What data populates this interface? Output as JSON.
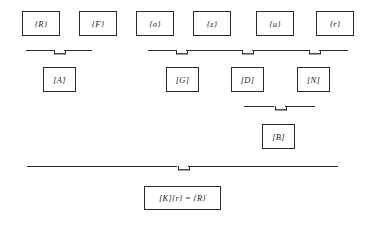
{
  "diagram": {
    "colors": {
      "stroke": "#2b2b2b",
      "text": "#1d1d1d",
      "background": "#ffffff"
    },
    "vectors": [
      {
        "label": "{R}",
        "name": "vector-R"
      },
      {
        "label": "{F}",
        "name": "vector-F"
      },
      {
        "label": "{σ}",
        "name": "vector-sigma"
      },
      {
        "label": "{ε}",
        "name": "vector-epsilon"
      },
      {
        "label": "{u}",
        "name": "vector-u"
      },
      {
        "label": "{r}",
        "name": "vector-r"
      }
    ],
    "matrices_row1": [
      {
        "label": "[A]",
        "name": "matrix-A"
      },
      {
        "label": "[G]",
        "name": "matrix-G"
      },
      {
        "label": "[D]",
        "name": "matrix-D"
      },
      {
        "label": "[N]",
        "name": "matrix-N"
      }
    ],
    "matrices_row2": [
      {
        "label": "[B]",
        "name": "matrix-B"
      }
    ],
    "equation": {
      "label": "[K]{r} = {R}",
      "name": "equation-K-r-R"
    },
    "braces": [
      {
        "name": "brace-A",
        "spans": [
          "{R}",
          "{F}"
        ],
        "target": "[A]"
      },
      {
        "name": "brace-G",
        "spans": [
          "{σ}",
          "{ε}"
        ],
        "target": "[G]"
      },
      {
        "name": "brace-D",
        "spans": [
          "{ε}",
          "{u}"
        ],
        "target": "[D]"
      },
      {
        "name": "brace-N",
        "spans": [
          "{u}",
          "{r}"
        ],
        "target": "[N]"
      },
      {
        "name": "brace-B",
        "spans": [
          "[D]",
          "[N]"
        ],
        "target": "[B]"
      },
      {
        "name": "brace-K",
        "spans": [
          "[A]",
          "[B]"
        ],
        "target": "[K]{r} = {R}"
      }
    ]
  }
}
